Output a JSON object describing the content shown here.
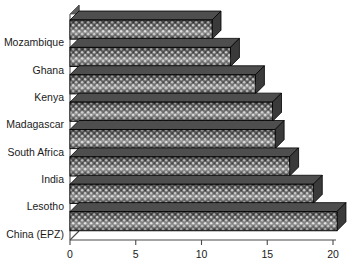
{
  "chart_data": {
    "type": "bar",
    "orientation": "horizontal",
    "title": "",
    "subtitle": "",
    "xlabel": "",
    "ylabel": "",
    "categories": [
      "Mozambique",
      "Ghana",
      "Kenya",
      "Madagascar",
      "South Africa",
      "India",
      "Lesotho",
      "China (EPZ)"
    ],
    "values": [
      10.8,
      12.2,
      14.1,
      15.4,
      15.6,
      16.7,
      18.5,
      20.3
    ],
    "xlim": [
      0,
      20
    ],
    "xticks": [
      0,
      5,
      10,
      15,
      20
    ],
    "xtick_labels": [
      "0",
      "5",
      "10",
      "15",
      "20"
    ],
    "grid": false,
    "legend": null,
    "style": {
      "bar_fill": "#5a5a5a",
      "bar_outline": "#000000",
      "bar_top_face": "#4e4e4e",
      "bar_side_face": "#3a3a3a",
      "axis_color": "#4a4a4a",
      "text_color": "#1a1a1a",
      "background": "#ffffff",
      "three_d": true,
      "pattern": "stipple-dots"
    }
  }
}
